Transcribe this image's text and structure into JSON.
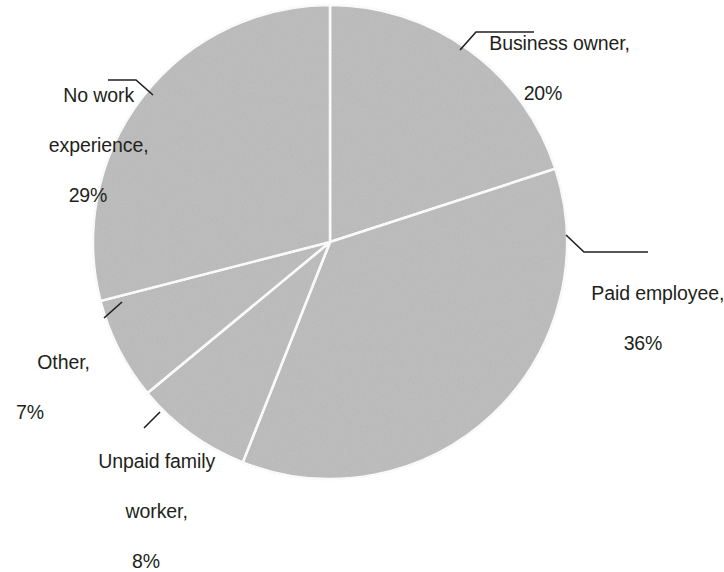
{
  "chart_data": {
    "type": "pie",
    "title": "",
    "subtitle": "",
    "xlabel": "",
    "ylabel": "",
    "legend_position": "none",
    "grid": false,
    "unit": "%",
    "start_angle_deg": 0,
    "direction": "clockwise",
    "categories": [
      "Business owner",
      "Paid employee",
      "Unpaid family worker",
      "Other",
      "No work experience"
    ],
    "values": [
      20,
      36,
      8,
      7,
      29
    ],
    "slices": [
      {
        "name": "Business owner",
        "value": 20,
        "label": "Business owner,",
        "percent_label": "20%",
        "color": "#dcdcdc"
      },
      {
        "name": "Paid employee",
        "value": 36,
        "label": "Paid employee,",
        "percent_label": "36%",
        "color": "#dcdcdc"
      },
      {
        "name": "Unpaid family worker",
        "value": 8,
        "label_line1": "Unpaid family",
        "label_line2": "worker,",
        "percent_label": "8%",
        "color": "#dcdcdc"
      },
      {
        "name": "Other",
        "value": 7,
        "label": "Other,",
        "percent_label": "7%",
        "color": "#dcdcdc"
      },
      {
        "name": "No work experience",
        "value": 29,
        "label_line1": "No work",
        "label_line2": "experience,",
        "percent_label": "29%",
        "color": "#dcdcdc"
      }
    ],
    "colors": {
      "slice_fill": "#dcdcdc",
      "slice_border": "#ffffff",
      "text": "#231f20",
      "leader_line": "#231f20",
      "background": "#ffffff"
    },
    "geometry": {
      "center_x": 330,
      "center_y": 242,
      "radius": 237
    }
  }
}
